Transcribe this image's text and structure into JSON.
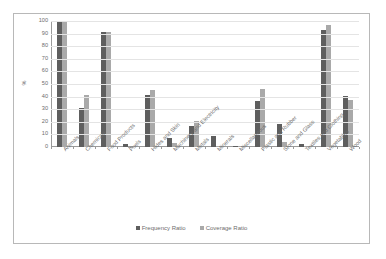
{
  "chart_data": {
    "type": "bar",
    "title": "",
    "xlabel": "",
    "ylabel": "%",
    "ylim": [
      0,
      100
    ],
    "ytick_step": 10,
    "yticks": [
      100,
      90,
      80,
      70,
      60,
      50,
      40,
      30,
      20,
      10,
      0
    ],
    "grid": true,
    "legend_position": "bottom",
    "categories": [
      "Animals",
      "Chemicals",
      "Food Products",
      "Fuels",
      "Hides and Skin",
      "Machinery and Electricity",
      "Metals",
      "Minerals",
      "Miscellaneous",
      "Plastic and Rubber",
      "Stone and Glass",
      "Textiles and Clothing",
      "Vegetables",
      "Wood"
    ],
    "series": [
      {
        "name": "Frequency Ratio",
        "color": "#5e5e5e",
        "values": [
          100,
          31,
          91,
          2,
          41,
          7,
          17,
          8.5,
          1,
          36.5,
          18.5,
          2.5,
          93,
          40.5
        ]
      },
      {
        "name": "Coverage Ratio",
        "color": "#a9a9a9",
        "values": [
          100,
          41.5,
          91,
          0.4,
          45,
          3,
          20.5,
          0.5,
          0.7,
          46,
          4,
          1,
          97,
          37
        ]
      }
    ]
  },
  "legend": {
    "items": [
      {
        "label": "Frequency Ratio"
      },
      {
        "label": "Coverage Ratio"
      }
    ]
  },
  "axis": {
    "y_title": "%"
  }
}
